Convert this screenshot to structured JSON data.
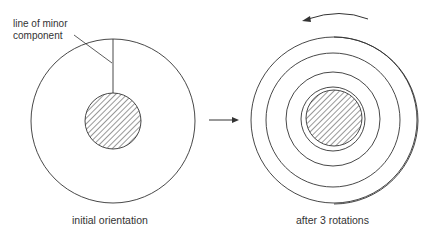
{
  "labels": {
    "minor_component_line1": "line of minor",
    "minor_component_line2": "component",
    "left_caption": "initial orientation",
    "right_caption": "after 3 rotations"
  },
  "diagram": {
    "left": {
      "shape": "circle with hatched core and radial line",
      "caption": "initial orientation"
    },
    "right": {
      "shape": "spiral with 3 turns around hatched core",
      "caption": "after 3 rotations",
      "rotation_arrow": "counter-clockwise"
    },
    "transition_arrow": "left to right"
  }
}
